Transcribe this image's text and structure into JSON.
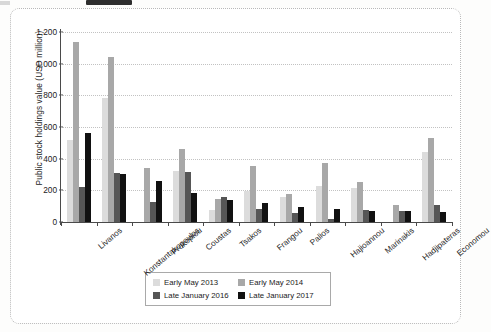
{
  "chart_data": {
    "type": "bar",
    "title": "",
    "xlabel": "",
    "ylabel": "Public stock holdings value (USD million)",
    "ylim": [
      0,
      1200
    ],
    "ytick_step": 200,
    "ytick_labels": [
      "1,200",
      "1,000",
      "800",
      "600",
      "400",
      "200",
      "0"
    ],
    "ytick_values": [
      1200,
      1000,
      800,
      600,
      400,
      200,
      0
    ],
    "grid": "horizontal-dotted",
    "legend_position": "bottom-center",
    "categories": [
      "Livanos",
      "Konstantakopoulos",
      "Prokopiou",
      "Coustas",
      "Tsakos",
      "Frangou",
      "Palios",
      "Hajioannou",
      "Marinakis",
      "Hadjipateras",
      "Economou"
    ],
    "series": [
      {
        "name": "Early May 2013",
        "color": "#dcdcdc",
        "values": [
          520,
          785,
          0,
          320,
          75,
          195,
          155,
          230,
          215,
          0,
          445
        ]
      },
      {
        "name": "Early May 2014",
        "color": "#a8a8a8",
        "values": [
          1140,
          1045,
          340,
          460,
          145,
          355,
          180,
          370,
          255,
          110,
          530
        ]
      },
      {
        "name": "Late January 2016",
        "color": "#565656",
        "values": [
          220,
          310,
          125,
          315,
          160,
          85,
          60,
          20,
          75,
          70,
          105
        ]
      },
      {
        "name": "Late January 2017",
        "color": "#111111",
        "values": [
          565,
          305,
          260,
          185,
          140,
          120,
          95,
          80,
          68,
          70,
          65
        ]
      }
    ]
  },
  "legend": {
    "items": [
      {
        "label": "Early May 2013",
        "color": "#dcdcdc"
      },
      {
        "label": "Early May 2014",
        "color": "#a8a8a8"
      },
      {
        "label": "Late January 2016",
        "color": "#565656"
      },
      {
        "label": "Late January 2017",
        "color": "#111111"
      }
    ]
  }
}
